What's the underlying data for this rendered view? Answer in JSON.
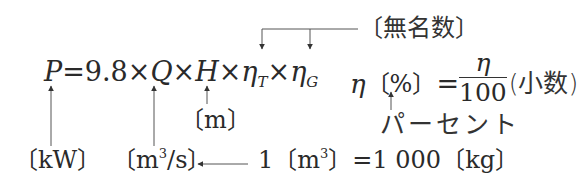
{
  "formula": {
    "power": "P",
    "equals": "=",
    "coefficient": "9.8",
    "times": "×",
    "flow": "Q",
    "head": "H",
    "eta": "η",
    "turbine_sub": "T",
    "generator_sub": "G"
  },
  "efficiency_note": {
    "eta": "η",
    "percent_unit": "〔%〕",
    "equals": "=",
    "numerator": "η",
    "denominator": "100",
    "decimal_label": "(小数)"
  },
  "annotations": {
    "dimensionless": "〔無名数〕",
    "power_unit": "〔kW〕",
    "head_unit": "〔m〕",
    "flow_unit_prefix": "〔m",
    "flow_unit_exp": "3",
    "flow_unit_suffix": "/s〕",
    "percent_label": "パーセント",
    "density_prefix": "1〔m",
    "density_exp": "3",
    "density_suffix": "〕=1 000〔kg〕"
  },
  "colors": {
    "text": "#2a2a2a",
    "line": "#444444",
    "background": "#ffffff"
  }
}
